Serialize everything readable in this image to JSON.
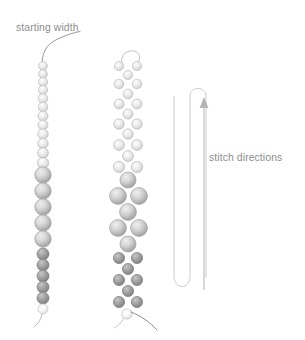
{
  "figure": {
    "background": "#ffffff",
    "label_color": "#8d8d8d",
    "thread_color": "#8b8b8b",
    "path_color": "#c9c9c9",
    "arrow_color": "#b0b0b0"
  },
  "labels": {
    "starting_width": "starting width",
    "stitch_directions": "stitch directions"
  },
  "bead_palette": {
    "light": {
      "fill": "#e2e2e2",
      "mid": "#f2f2f2",
      "edge": "#bdbdbd"
    },
    "medium": {
      "fill": "#cfcfcf",
      "mid": "#e6e6e6",
      "edge": "#a8a8a8"
    },
    "dark": {
      "fill": "#9b9b9b",
      "mid": "#bdbdbd",
      "edge": "#7d7d7d"
    },
    "tail": {
      "fill": "#f0f0f0",
      "mid": "#fbfbfb",
      "edge": "#c4c4c4"
    }
  },
  "columns": [
    {
      "name": "single-strand-column",
      "cx": 43,
      "leader_thread": "curved thread exiting top of first bead",
      "beads": [
        {
          "cy": 66,
          "r": 4.4,
          "tone": "light"
        },
        {
          "cy": 74,
          "r": 4.4,
          "tone": "light"
        },
        {
          "cy": 82,
          "r": 4.6,
          "tone": "light"
        },
        {
          "cy": 90,
          "r": 4.6,
          "tone": "light"
        },
        {
          "cy": 98.5,
          "r": 4.8,
          "tone": "light"
        },
        {
          "cy": 107,
          "r": 4.8,
          "tone": "light"
        },
        {
          "cy": 116,
          "r": 5.0,
          "tone": "light"
        },
        {
          "cy": 125,
          "r": 5.0,
          "tone": "light"
        },
        {
          "cy": 134,
          "r": 5.2,
          "tone": "light"
        },
        {
          "cy": 143.5,
          "r": 5.2,
          "tone": "light"
        },
        {
          "cy": 153,
          "r": 5.4,
          "tone": "light"
        },
        {
          "cy": 163,
          "r": 5.6,
          "tone": "light"
        },
        {
          "cy": 174,
          "r": 8.2,
          "tone": "medium"
        },
        {
          "cy": 190,
          "r": 8.2,
          "tone": "medium"
        },
        {
          "cy": 206,
          "r": 8.2,
          "tone": "medium"
        },
        {
          "cy": 222,
          "r": 8.2,
          "tone": "medium"
        },
        {
          "cy": 238,
          "r": 8.2,
          "tone": "medium"
        },
        {
          "cy": 253,
          "r": 6.0,
          "tone": "dark"
        },
        {
          "cy": 264,
          "r": 6.0,
          "tone": "dark"
        },
        {
          "cy": 275,
          "r": 6.0,
          "tone": "dark"
        },
        {
          "cy": 286,
          "r": 6.0,
          "tone": "dark"
        },
        {
          "cy": 297,
          "r": 6.0,
          "tone": "dark"
        },
        {
          "cy": 308,
          "r": 5.0,
          "tone": "tail"
        }
      ],
      "tails": [
        "short thread curving down-left from final bead"
      ]
    },
    {
      "name": "peyote-strand-column",
      "cx": 128,
      "offset": 9,
      "top_loop": "small thread loop arc above first bead pair",
      "rows": [
        {
          "cy": 66,
          "r": 4.6,
          "tone": "light",
          "kind": "pair"
        },
        {
          "cy": 75,
          "r": 4.6,
          "tone": "light",
          "kind": "single"
        },
        {
          "cy": 84,
          "r": 4.8,
          "tone": "light",
          "kind": "pair"
        },
        {
          "cy": 94,
          "r": 4.8,
          "tone": "light",
          "kind": "single"
        },
        {
          "cy": 104,
          "r": 5.0,
          "tone": "light",
          "kind": "pair"
        },
        {
          "cy": 114,
          "r": 5.0,
          "tone": "light",
          "kind": "single"
        },
        {
          "cy": 124,
          "r": 5.2,
          "tone": "light",
          "kind": "pair"
        },
        {
          "cy": 134,
          "r": 5.2,
          "tone": "light",
          "kind": "single"
        },
        {
          "cy": 145,
          "r": 5.4,
          "tone": "light",
          "kind": "pair"
        },
        {
          "cy": 156,
          "r": 5.4,
          "tone": "light",
          "kind": "single"
        },
        {
          "cy": 167,
          "r": 5.6,
          "tone": "light",
          "kind": "pair"
        },
        {
          "cy": 180,
          "r": 8.0,
          "tone": "medium",
          "kind": "single"
        },
        {
          "cy": 196,
          "r": 8.4,
          "tone": "medium",
          "kind": "pair"
        },
        {
          "cy": 212,
          "r": 8.4,
          "tone": "medium",
          "kind": "single"
        },
        {
          "cy": 228,
          "r": 8.4,
          "tone": "medium",
          "kind": "pair"
        },
        {
          "cy": 244,
          "r": 8.0,
          "tone": "medium",
          "kind": "single"
        },
        {
          "cy": 258,
          "r": 5.6,
          "tone": "dark",
          "kind": "pair"
        },
        {
          "cy": 269,
          "r": 5.6,
          "tone": "dark",
          "kind": "single"
        },
        {
          "cy": 280,
          "r": 5.6,
          "tone": "dark",
          "kind": "pair"
        },
        {
          "cy": 291,
          "r": 5.6,
          "tone": "dark",
          "kind": "single"
        },
        {
          "cy": 302,
          "r": 5.6,
          "tone": "dark",
          "kind": "pair"
        },
        {
          "cy": 314,
          "r": 5.2,
          "tone": "tail",
          "kind": "single"
        }
      ],
      "tails": [
        "short pale thread curving down-left from final bead",
        "long dark thread sweeping down-right from final bead"
      ]
    }
  ],
  "stitch_path": {
    "name": "serpentine-stitch-path",
    "description": "boustrophedon path of three vertical legs joined by rounded turns",
    "legs": [
      {
        "x": 174,
        "y_top": 95,
        "y_bottom": 290,
        "turn": "bottom"
      },
      {
        "x": 190,
        "y_top": 90,
        "y_bottom": 290,
        "turn": "top"
      },
      {
        "x": 206,
        "y_top": 90,
        "y_bottom": 292,
        "turn": "bottom"
      }
    ],
    "stroke": "#cacaca",
    "stroke_width": 1
  },
  "direction_arrow": {
    "name": "stitch-direction-arrow",
    "x": 204,
    "y_tail": 290,
    "y_head": 100,
    "points": "up",
    "color": "#b3b3b3"
  }
}
